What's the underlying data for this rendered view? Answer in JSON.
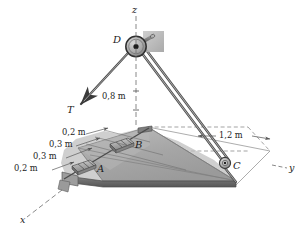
{
  "figure": {
    "background_color": "#ffffff",
    "ink_color": "#1b1b1b",
    "plate_fill": "#a9a9a9",
    "plate_fill_light": "#c2c2c2",
    "plate_fill_dark": "#8e8e8e",
    "wall_fill": "#b5b5b5",
    "cable_color": "#6e6e6e"
  },
  "axes": {
    "z_label": "z",
    "y_label": "y",
    "x_label": "x"
  },
  "points": {
    "A": "A",
    "B": "B",
    "C": "C",
    "D": "D"
  },
  "force": {
    "label": "T"
  },
  "dimensions": {
    "height": "0,8 m",
    "span_y": "1,2 m",
    "offsets": [
      "0,2 m",
      "0,3 m",
      "0,3 m",
      "0,2 m"
    ]
  }
}
